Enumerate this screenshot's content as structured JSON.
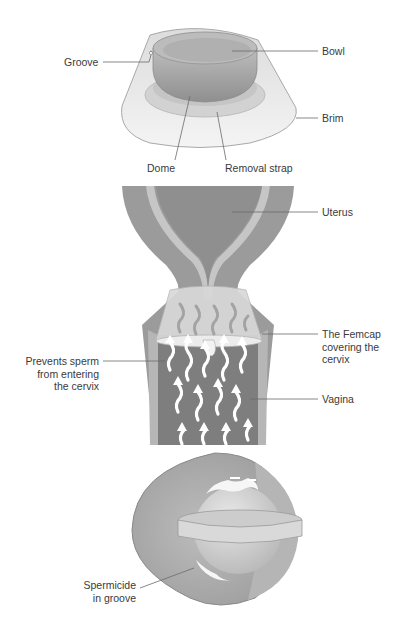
{
  "diagram": {
    "type": "medical-illustration",
    "panels": [
      {
        "name": "femcap-device",
        "labels": {
          "groove": "Groove",
          "bowl": "Bowl",
          "brim": "Brim",
          "dome": "Dome",
          "removal_strap": "Removal strap"
        }
      },
      {
        "name": "femcap-in-place",
        "labels": {
          "uterus": "Uterus",
          "femcap_line1": "The Femcap",
          "femcap_line2": "covering the",
          "femcap_line3": "cervix",
          "prevents_line1": "Prevents sperm",
          "prevents_line2": "from entering",
          "prevents_line3": "the cervix",
          "vagina": "Vagina"
        }
      },
      {
        "name": "femcap-spermicide",
        "labels": {
          "spermicide_line1": "Spermicide",
          "spermicide_line2": "in groove"
        }
      }
    ],
    "colors": {
      "tissue_dark": "#8c8c8c",
      "tissue_mid": "#a6a6a6",
      "tissue_light": "#c8c8c8",
      "cap_light": "#e6e6e6",
      "leader": "#6b6b6b",
      "text": "#3a3a3a"
    }
  }
}
